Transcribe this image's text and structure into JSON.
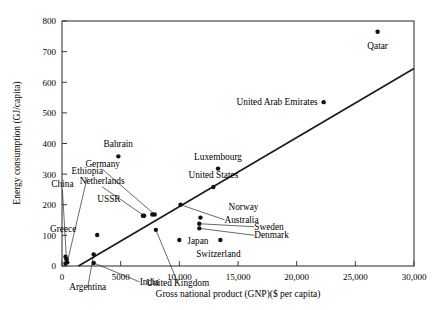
{
  "figure": {
    "background_color": "#ffffff",
    "ink_color": "#000000"
  },
  "chart_data": {
    "type": "scatter",
    "title": "",
    "xlabel": "Gross national product (GNP)($ per capita)",
    "ylabel": "Energy consumption (GJ/capita)",
    "xlim": [
      0,
      30000
    ],
    "ylim": [
      0,
      800
    ],
    "xticks": [
      0,
      5000,
      10000,
      15000,
      20000,
      25000,
      30000
    ],
    "xtick_labels": [
      "0",
      "5000",
      "10,000",
      "15,000",
      "20,000",
      "25,000",
      "30,000"
    ],
    "yticks": [
      0,
      100,
      200,
      300,
      400,
      500,
      600,
      700,
      800
    ],
    "ytick_labels": [
      "0",
      "100",
      "200",
      "300",
      "400",
      "500",
      "600",
      "700",
      "800"
    ],
    "grid": false,
    "legend": "none",
    "marker": "filled-circle",
    "trend_line": {
      "name": "linear fit",
      "x": [
        1400,
        30000
      ],
      "y": [
        0,
        645
      ]
    },
    "points": [
      {
        "label": "Qatar",
        "x": 26900,
        "y": 765,
        "label_dx": 0,
        "label_dy": 17,
        "label_anchor": "middle",
        "leader": false
      },
      {
        "label": "United Arab Emirates",
        "x": 22300,
        "y": 535,
        "label_dx": -6,
        "label_dy": 3,
        "label_anchor": "end",
        "leader": false
      },
      {
        "label": "Bahrain",
        "x": 4800,
        "y": 358,
        "label_dx": 0,
        "label_dy": -9,
        "label_anchor": "middle",
        "leader": false
      },
      {
        "label": "Luxembourg",
        "x": 13300,
        "y": 318,
        "label_dx": 0,
        "label_dy": -9,
        "label_anchor": "middle",
        "leader": false
      },
      {
        "label": "United States",
        "x": 12900,
        "y": 258,
        "label_dx": 0,
        "label_dy": -9,
        "label_anchor": "middle",
        "leader": false
      },
      {
        "label": "Germany",
        "x": 7900,
        "y": 168,
        "label_dx": -52,
        "label_dy": -48,
        "label_anchor": "middle",
        "leader": true
      },
      {
        "label": "Netherlands",
        "x": 7000,
        "y": 164,
        "label_dx": -42,
        "label_dy": -32,
        "label_anchor": "middle",
        "leader": true
      },
      {
        "label": "USSR",
        "x": 6900,
        "y": 164,
        "label_dx": -34,
        "label_dy": -14,
        "label_anchor": "middle",
        "leader": false
      },
      {
        "label": "Australia",
        "x": 10100,
        "y": 200,
        "label_dx": 44,
        "label_dy": 18,
        "label_anchor": "start",
        "leader": true
      },
      {
        "label": "Norway",
        "x": 11800,
        "y": 158,
        "label_dx": 28,
        "label_dy": -8,
        "label_anchor": "start",
        "leader": false
      },
      {
        "label": "Sweden",
        "x": 11700,
        "y": 138,
        "label_dx": 55,
        "label_dy": 6,
        "label_anchor": "start",
        "leader": true
      },
      {
        "label": "Denmark",
        "x": 11700,
        "y": 123,
        "label_dx": 55,
        "label_dy": 10,
        "label_anchor": "start",
        "leader": true
      },
      {
        "label": "Switzerland",
        "x": 13500,
        "y": 85,
        "label_dx": -2,
        "label_dy": 17,
        "label_anchor": "middle",
        "leader": false
      },
      {
        "label": "Japan",
        "x": 10000,
        "y": 85,
        "label_dx": 8,
        "label_dy": 4,
        "label_anchor": "start",
        "leader": false
      },
      {
        "label": "United Kingdom",
        "x": 8000,
        "y": 118,
        "label_dx": 22,
        "label_dy": 56,
        "label_anchor": "middle",
        "leader": true
      },
      {
        "label": "Greece",
        "x": 3000,
        "y": 101,
        "label_dx": -34,
        "label_dy": -3,
        "label_anchor": "middle",
        "leader": false
      },
      {
        "label": "Ethiopia",
        "x": 450,
        "y": 12,
        "label_dx": 20,
        "label_dy": -88,
        "label_anchor": "middle",
        "leader": true
      },
      {
        "label": "China",
        "x": 380,
        "y": 22,
        "label_dx": -4,
        "label_dy": -72,
        "label_anchor": "middle",
        "leader": true
      },
      {
        "label": "Argentina",
        "x": 2700,
        "y": 38,
        "label_dx": -6,
        "label_dy": 36,
        "label_anchor": "middle",
        "leader": true
      },
      {
        "label": "India",
        "x": 2700,
        "y": 10,
        "label_dx": 46,
        "label_dy": 22,
        "label_anchor": "start",
        "leader": true
      },
      {
        "label": "",
        "x": 300,
        "y": 30,
        "leader": false
      },
      {
        "label": "",
        "x": 300,
        "y": 8,
        "leader": false
      },
      {
        "label": "",
        "x": 7700,
        "y": 168,
        "leader": false
      }
    ]
  }
}
